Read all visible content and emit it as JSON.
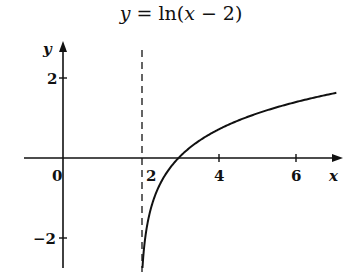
{
  "chart_data": {
    "type": "line",
    "title": "y = ln(x − 2)",
    "xlabel": "x",
    "ylabel": "y",
    "xticks": [
      0,
      2,
      4,
      6
    ],
    "yticks": [
      2,
      -2
    ],
    "xlim": [
      -0.9,
      7.4
    ],
    "ylim": [
      -2.75,
      2.9
    ],
    "asymptote": {
      "x": 2,
      "style": "dashed"
    },
    "series": [
      {
        "name": "ln(x-2)",
        "function": "ln(x-2)",
        "x": [
          2.064,
          2.1,
          2.2,
          2.5,
          3,
          4,
          5,
          6,
          7.1
        ],
        "values": [
          -2.75,
          -2.3,
          -1.61,
          -0.69,
          0,
          0.69,
          1.1,
          1.39,
          1.63
        ]
      }
    ],
    "grid": false,
    "legend": null
  },
  "labels": {
    "title_y": "y",
    "title_eq": " = ln(",
    "title_x": "x",
    "title_rest": " − 2)",
    "x_axis": "x",
    "y_axis": "y",
    "tick_x0": "0",
    "tick_x2": "2",
    "tick_x4": "4",
    "tick_x6": "6",
    "tick_y2": "2",
    "tick_yn2": "−2"
  },
  "colors": {
    "ink": "#111111",
    "background": "#ffffff"
  }
}
